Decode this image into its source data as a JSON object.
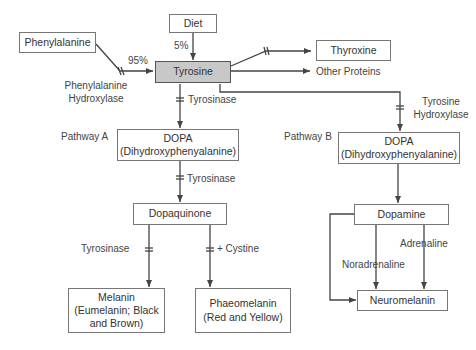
{
  "nodes": {
    "diet": "Diet",
    "phenylalanine": "Phenylalanine",
    "tyrosine": "Tyrosine",
    "thyroxine": "Thyroxine",
    "other_proteins": "Other Proteins",
    "dopa_a": {
      "line1": "DOPA",
      "line2": "(Dihydroxyphenyalanine)"
    },
    "dopa_b": {
      "line1": "DOPA",
      "line2": "(Dihydroxyphenyalanine)"
    },
    "dopaquinone": "Dopaquinone",
    "melanin": {
      "line1": "Melanin",
      "line2": "(Eumelanin; Black",
      "line3": "and Brown)"
    },
    "phaeomelanin": {
      "line1": "Phaeomelanin",
      "line2": "(Red and Yellow)"
    },
    "dopamine": "Dopamine",
    "neuromelanin": "Neuromelanin"
  },
  "labels": {
    "diet_percent": "5%",
    "phenylalanine_percent": "95%",
    "phenylalanine_hydroxylase": {
      "line1": "Phenylalanine",
      "line2": "Hydroxylase"
    },
    "tyrosinase_1": "Tyrosinase",
    "tyrosinase_2": "Tyrosinase",
    "tyrosinase_3": "Tyrosinase",
    "cystine": "+ Cystine",
    "tyrosine_hydroxylase": {
      "line1": "Tyrosine",
      "line2": "Hydroxylase"
    },
    "pathway_a": "Pathway A",
    "pathway_b": "Pathway B",
    "noradrenaline": "Noradrenaline",
    "adrenaline": "Adrenaline"
  },
  "colors": {
    "line": "#444444",
    "box_border": "#777777",
    "highlight_fill": "#c8c8c8"
  }
}
